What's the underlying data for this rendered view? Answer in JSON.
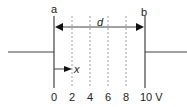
{
  "diagram": {
    "plate_a_label": "a",
    "plate_b_label": "b",
    "distance_label": "d",
    "position_label": "x",
    "tick_labels": [
      "0",
      "2",
      "4",
      "6",
      "8",
      "10 V"
    ],
    "equipotentials_volts": [
      2,
      4,
      6,
      8
    ],
    "unit": "V"
  }
}
